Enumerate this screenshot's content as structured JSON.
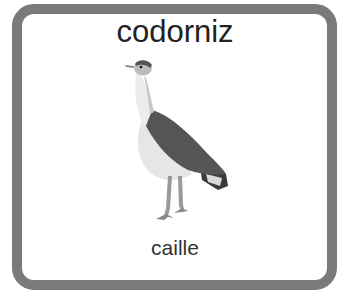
{
  "card": {
    "title": "codorniz",
    "subtitle": "caille",
    "image": "bird-illustration",
    "border_color": "#7a7a7a"
  }
}
